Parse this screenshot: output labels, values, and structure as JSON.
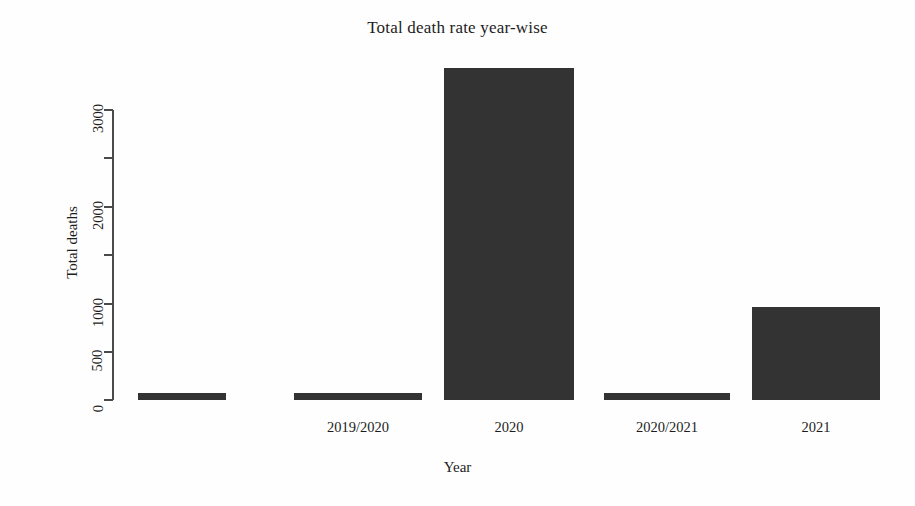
{
  "chart_data": {
    "type": "bar",
    "title": "Total death rate year-wise",
    "xlabel": "Year",
    "ylabel": "Total deaths",
    "categories": [
      "",
      "2019/2020",
      "2020",
      "2020/2021",
      "2021"
    ],
    "values": [
      70,
      70,
      3435,
      70,
      960
    ],
    "ylim": [
      0,
      3435
    ],
    "y_ticks": [
      0,
      500,
      1000,
      1500,
      2000,
      2500,
      3000
    ],
    "y_tick_labels": [
      "0",
      "500",
      "1000",
      "",
      "2000",
      "",
      "3000"
    ],
    "x_tick_labels": [
      "",
      "2019/2020",
      "2020",
      "2020/2021",
      "2021"
    ],
    "grid": false,
    "legend": false,
    "bar_color": "#333333",
    "axis_color": "#4a4a4a",
    "background": "#fefefe"
  },
  "axes": {
    "y_ticks": [
      {
        "label": "3000",
        "y": 110
      },
      {
        "label": "",
        "y": 158
      },
      {
        "label": "2000",
        "y": 207
      },
      {
        "label": "",
        "y": 255
      },
      {
        "label": "1000",
        "y": 304
      },
      {
        "label": "500",
        "y": 352
      },
      {
        "label": "0",
        "y": 400
      }
    ]
  },
  "bars": [
    {
      "name": "bar-1",
      "label": "",
      "value": 70,
      "x": 138,
      "width": 88,
      "top": 393,
      "height": 7
    },
    {
      "name": "bar-2",
      "label": "2019/2020",
      "value": 70,
      "x": 294,
      "width": 128,
      "top": 393,
      "height": 7
    },
    {
      "name": "bar-3",
      "label": "2020",
      "value": 3435,
      "x": 444,
      "width": 130,
      "top": 68,
      "height": 332
    },
    {
      "name": "bar-4",
      "label": "2020/2021",
      "value": 70,
      "x": 604,
      "width": 126,
      "top": 393,
      "height": 7
    },
    {
      "name": "bar-5",
      "label": "2021",
      "value": 960,
      "x": 752,
      "width": 128,
      "top": 307,
      "height": 93
    }
  ],
  "x_labels": [
    {
      "text": "2019/2020",
      "center": 358
    },
    {
      "text": "2020",
      "center": 509
    },
    {
      "text": "2020/2021",
      "center": 667
    },
    {
      "text": "2021",
      "center": 816
    }
  ]
}
